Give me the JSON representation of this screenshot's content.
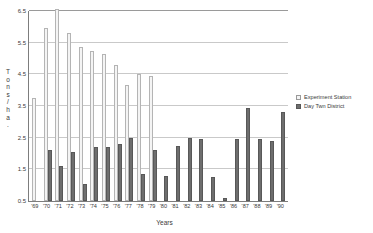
{
  "chart_data": {
    "type": "bar",
    "title": "",
    "xlabel": "Years",
    "ylabel": "Tons/ha.",
    "ylabel_chars": [
      "T",
      "o",
      "n",
      "s",
      "/",
      "h",
      "a",
      "."
    ],
    "ylim": [
      0.5,
      6.5
    ],
    "ytick_values": [
      0.5,
      1.5,
      2.5,
      3.5,
      4.5,
      5.5,
      6.5
    ],
    "ytick_labels": [
      "0.5",
      "1.5",
      "2.5",
      "3.5",
      "4.5",
      "5.5",
      "6.5"
    ],
    "grid": true,
    "legend_position": "right",
    "categories": [
      "'69",
      "'70",
      "'71",
      "'72",
      "'73",
      "'74",
      "'75",
      "'76",
      "'77",
      "'78",
      "'79",
      "'80",
      "'81",
      "'82",
      "'83",
      "'84",
      "'85",
      "'86",
      "'87",
      "'88",
      "'89",
      "'90"
    ],
    "series": [
      {
        "name": "Experiment Station",
        "color": "#f4f4f4",
        "values": [
          3.75,
          5.95,
          6.55,
          5.8,
          5.35,
          5.25,
          5.15,
          4.8,
          4.15,
          4.5,
          4.45,
          null,
          null,
          null,
          null,
          null,
          null,
          null,
          null,
          null,
          null,
          null
        ]
      },
      {
        "name": "Day Twn District",
        "color": "#6e6e6e",
        "values": [
          null,
          2.1,
          1.6,
          2.05,
          1.05,
          2.2,
          2.2,
          2.3,
          2.5,
          1.35,
          2.1,
          1.3,
          2.25,
          2.5,
          2.45,
          1.25,
          0.6,
          2.45,
          3.45,
          2.45,
          2.4,
          3.3
        ]
      }
    ]
  },
  "legend": {
    "items": [
      {
        "label": "Experiment Station",
        "style": "light"
      },
      {
        "label": "Day Twn District",
        "style": "dark"
      }
    ]
  }
}
